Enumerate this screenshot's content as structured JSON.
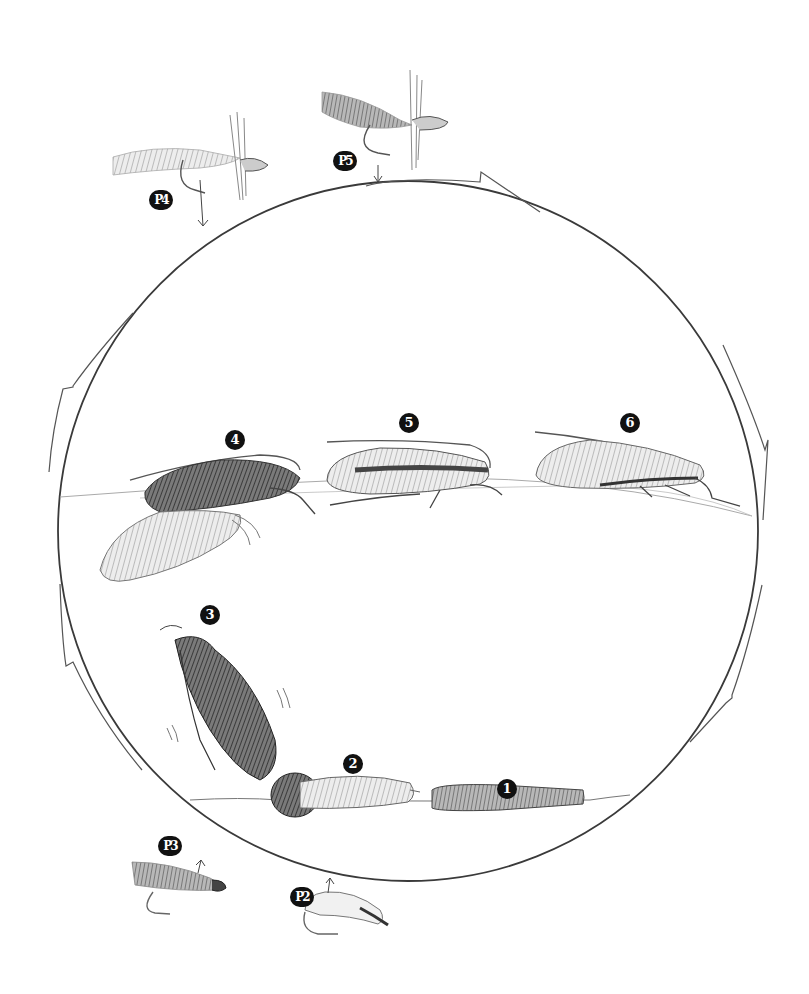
{
  "diagram": {
    "colors": {
      "ink": "#3a3a3a",
      "light_ink": "#8a8a8a",
      "badge": "#111111",
      "background": "#ffffff"
    },
    "stages": [
      {
        "id": "1",
        "label": "1",
        "depiction": "cased larva on stream bottom"
      },
      {
        "id": "2",
        "label": "2",
        "depiction": "larva out of case / pupa on bottom"
      },
      {
        "id": "3",
        "label": "3",
        "depiction": "emerging pupa swimming to surface"
      },
      {
        "id": "4",
        "label": "4",
        "depiction": "adult emerging from pupal shuck at surface"
      },
      {
        "id": "5",
        "label": "5",
        "depiction": "adult on water surface"
      },
      {
        "id": "6",
        "label": "6",
        "depiction": "adult on water surface (egg-laying)"
      }
    ],
    "patterns": [
      {
        "id": "P2",
        "label": "P2",
        "depiction": "pupa / larva imitation fly",
        "arrow": "up"
      },
      {
        "id": "P3",
        "label": "P3",
        "depiction": "wet fly (soft hackle streamer)",
        "arrow": "up"
      },
      {
        "id": "P4",
        "label": "P4",
        "depiction": "emerger dry fly with trailing shuck",
        "arrow": "down"
      },
      {
        "id": "P5",
        "label": "P5",
        "depiction": "elk-hair caddis dry fly",
        "arrow": "down"
      }
    ],
    "cycle": {
      "shape": "circle",
      "direction": "clockwise",
      "arrows": 5
    }
  }
}
